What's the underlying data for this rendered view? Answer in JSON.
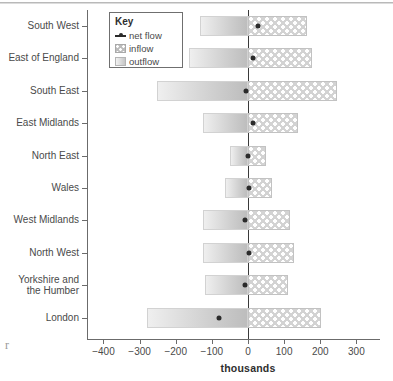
{
  "chart_data": {
    "type": "bar",
    "title": "",
    "subtitle": "",
    "xlabel": "thousands",
    "ylabel": "",
    "xlim": [
      -400,
      300
    ],
    "xticks": [
      -400,
      -300,
      -200,
      -100,
      0,
      100,
      200,
      300
    ],
    "xtick_labels": [
      "−400",
      "−300",
      "−200",
      "−100",
      "0",
      "100",
      "200",
      "300"
    ],
    "grid": false,
    "orientation": "horizontal",
    "zero_line": 0,
    "legend": {
      "title": "Key",
      "position": "top-left-inside",
      "entries": [
        {
          "label": "net flow",
          "marker": "line-with-dot",
          "color": "#2b2b2b"
        },
        {
          "label": "inflow",
          "marker": "dotted-fill-swatch",
          "color": "#bcbcbc"
        },
        {
          "label": "outflow",
          "marker": "gradient-fill-swatch",
          "color": "#c6c6c6"
        }
      ]
    },
    "categories": [
      "South West",
      "East of England",
      "South East",
      "East Midlands",
      "North East",
      "Wales",
      "West Midlands",
      "North West",
      "Yorkshire and\nthe Humber",
      "London"
    ],
    "series": [
      {
        "name": "outflow",
        "values": [
          -134,
          -163,
          -251,
          -124,
          -50,
          -63,
          -124,
          -124,
          -119,
          -280
        ]
      },
      {
        "name": "inflow",
        "values": [
          163,
          177,
          246,
          138,
          50,
          66,
          116,
          127,
          110,
          201
        ]
      },
      {
        "name": "net flow",
        "values": [
          29,
          14,
          -5,
          14,
          0,
          3,
          -8,
          3,
          -9,
          -79
        ]
      }
    ]
  },
  "axis": {
    "units_label": "thousands"
  }
}
